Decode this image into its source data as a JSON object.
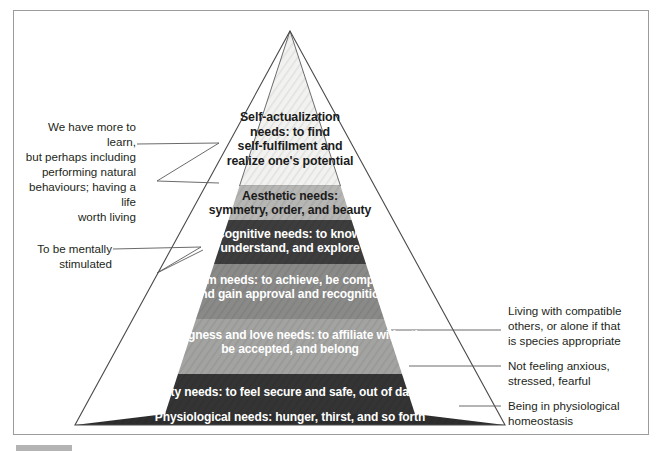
{
  "figure": {
    "type": "pyramid-diagram",
    "title_text": "Maslow's hierarchy of needs",
    "apex_label": "pyramid-apex"
  },
  "pyramid": {
    "levels": [
      {
        "id": "self-actualization",
        "order": 1,
        "text": "Self-actualization needs: to find self-fulfilment and realize one's potential",
        "line1": "Self-actualization",
        "line2": "needs: to find",
        "line3": "self-fulfilment and",
        "line4": "realize one's potential",
        "fill": "#f2f2f0",
        "text_color": "#1b1b1b"
      },
      {
        "id": "aesthetic",
        "order": 2,
        "text": "Aesthetic needs: symmetry, order, and beauty",
        "line1": "Aesthetic needs:",
        "line2": "symmetry, order, and beauty",
        "fill": "#b6b6b4",
        "text_color": "#1b1b1b"
      },
      {
        "id": "cognitive",
        "order": 3,
        "text": "Cognitive needs: to know, understand, and explore",
        "line1": "Cognitive needs: to know,",
        "line2": "understand, and explore",
        "fill": "#3d3d3d",
        "text_color": "#ffffff"
      },
      {
        "id": "esteem",
        "order": 4,
        "text": "Esteem needs: to achieve, be competent, and gain approval and recognition",
        "line1": "Esteem needs: to achieve, be competent,",
        "line2": "and gain approval and recognition",
        "fill": "#8a8a88",
        "text_color": "#ffffff"
      },
      {
        "id": "belongingness-and-love",
        "order": 5,
        "text": "Belongingness and love needs: to affiliate with others, be accepted, and belong",
        "line1": "Belongingness and love needs: to affiliate with others,",
        "line2": "be accepted, and belong",
        "fill": "#a3a3a1",
        "text_color": "#ffffff"
      },
      {
        "id": "safety",
        "order": 6,
        "text": "Safety needs: to feel secure and safe, out of danger",
        "line1": "Safety needs: to feel secure and safe, out of danger",
        "fill": "#343434",
        "text_color": "#ffffff"
      },
      {
        "id": "physiological",
        "order": 7,
        "text": "Physiological needs: hunger, thirst, and so forth",
        "line1": "Physiological needs: hunger, thirst, and so forth",
        "fill": "#2e2e2e",
        "text_color": "#ffffff"
      }
    ]
  },
  "annotations": {
    "left": [
      {
        "id": "self-actualization-note",
        "target": "self-actualization",
        "lines": [
          "We have more to learn,",
          "but perhaps including",
          "performing natural",
          "behaviours; having a life",
          "worth living"
        ],
        "text": "We have more to learn, but perhaps including performing natural behaviours; having a life worth living"
      },
      {
        "id": "cognitive-note",
        "target": "cognitive",
        "lines": [
          "To be mentally",
          "stimulated"
        ],
        "text": "To be mentally stimulated"
      }
    ],
    "right": [
      {
        "id": "belongingness-note",
        "target": "belongingness-and-love",
        "lines": [
          "Living with compatible",
          "others, or alone if that",
          "is species appropriate"
        ],
        "text": "Living with compatible others, or alone if that is species appropriate"
      },
      {
        "id": "safety-note",
        "target": "safety",
        "lines": [
          "Not feeling anxious,",
          "stressed, fearful"
        ],
        "text": "Not feeling anxious, stressed, fearful"
      },
      {
        "id": "physiological-note",
        "target": "physiological",
        "lines": [
          "Being in physiological",
          "homeostasis"
        ],
        "text": "Being in physiological homeostasis"
      }
    ]
  },
  "colors": {
    "frame_border": "#9b9b9b",
    "leader_line": "#5a5a5a",
    "background": "#ffffff",
    "text": "#231f20"
  }
}
